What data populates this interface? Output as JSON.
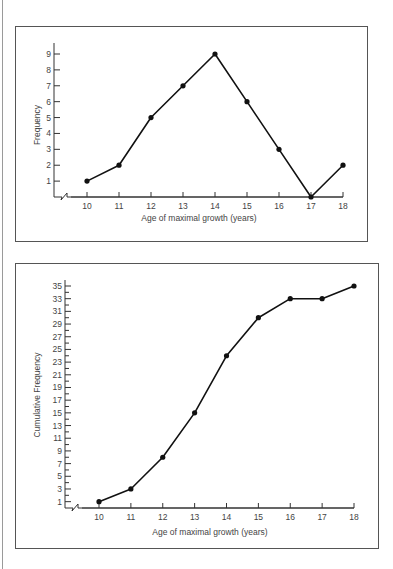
{
  "chart_data": [
    {
      "type": "line",
      "title": "",
      "xlabel": "Age of maximal growth (years)",
      "ylabel": "Frequency",
      "categories": [
        "10",
        "11",
        "12",
        "13",
        "14",
        "15",
        "16",
        "17",
        "18"
      ],
      "x": [
        10,
        11,
        12,
        13,
        14,
        15,
        16,
        17,
        18
      ],
      "values": [
        1,
        2,
        5,
        7,
        9,
        6,
        3,
        0,
        2
      ],
      "yticks": [
        1,
        2,
        3,
        4,
        5,
        6,
        7,
        8,
        9
      ],
      "ylim": [
        0,
        9
      ],
      "xlim": [
        10,
        18
      ],
      "axis_break": "x-axis break symbol before 10",
      "grid": false,
      "legend": null,
      "markers": true
    },
    {
      "type": "line",
      "title": "",
      "xlabel": "Age of maximal growth (years)",
      "ylabel": "Cumulative Frequency",
      "categories": [
        "10",
        "11",
        "12",
        "13",
        "14",
        "15",
        "16",
        "17",
        "18"
      ],
      "x": [
        10,
        11,
        12,
        13,
        14,
        15,
        16,
        17,
        18
      ],
      "values": [
        1,
        3,
        8,
        15,
        24,
        30,
        33,
        33,
        35
      ],
      "yticks": [
        1,
        3,
        5,
        7,
        9,
        11,
        13,
        15,
        17,
        19,
        21,
        23,
        25,
        27,
        29,
        31,
        33,
        35
      ],
      "ylim": [
        0,
        35
      ],
      "xlim": [
        10,
        18
      ],
      "axis_break": "x-axis break symbol before 10",
      "grid": false,
      "legend": null,
      "markers": true
    }
  ],
  "charts": {
    "frequency": {
      "ylabel": "Frequency",
      "xlabel": "Age of maximal growth (years)"
    },
    "cumulative": {
      "ylabel": "Cumulative Frequency",
      "xlabel": "Age of maximal growth (years)"
    }
  }
}
